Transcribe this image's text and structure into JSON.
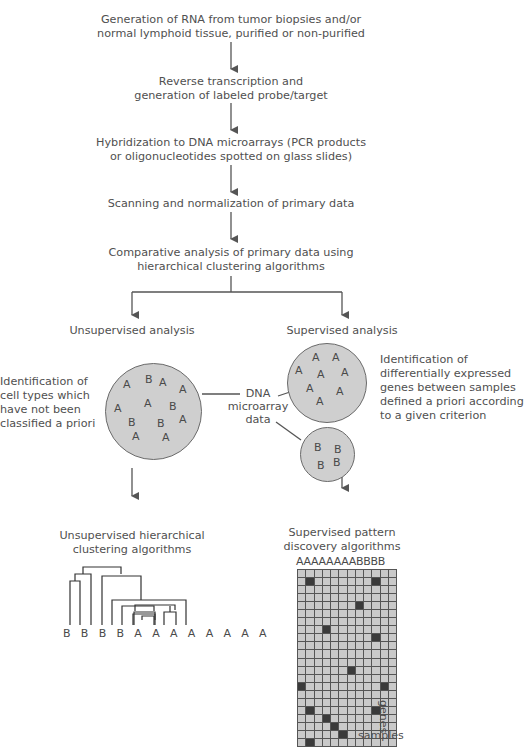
{
  "steps": [
    {
      "line1": "Generation of RNA from tumor biopsies and/or",
      "line2": "normal lymphoid tissue, purified or non-purified"
    },
    {
      "line1": "Reverse transcription and",
      "line2": "generation of labeled probe/target"
    },
    {
      "line1": "Hybridization to DNA microarrays (PCR products",
      "line2": "or oligonucleotides spotted on glass slides)"
    },
    {
      "line1": "Scanning and normalization of primary data",
      "line2": ""
    },
    {
      "line1": "Comparative analysis of primary data using",
      "line2": "hierarchical clustering algorithms"
    }
  ],
  "branches": {
    "unsupervised": {
      "title": "Unsupervised analysis",
      "description": [
        "Identification of",
        "cell types which",
        "have not been",
        "classified a priori"
      ],
      "circle_labels": [
        "A",
        "B",
        "A",
        "A",
        "A",
        "A",
        "B",
        "A",
        "B",
        "B",
        "A",
        "A",
        "A"
      ],
      "algorithm": [
        "Unsupervised hierarchical",
        "clustering algorithms"
      ],
      "dendrogram_leaves": "B B B B A A A A A A A A"
    },
    "supervised": {
      "title": "Supervised analysis",
      "description": [
        "Identification of",
        "differentially expressed",
        "genes between samples",
        "defined a priori according",
        "to a given criterion"
      ],
      "circle_a_labels": [
        "A",
        "A",
        "A",
        "A",
        "A",
        "A",
        "A",
        "A"
      ],
      "circle_b_labels": [
        "B",
        "B",
        "B",
        "B"
      ],
      "algorithm": [
        "Supervised pattern",
        "discovery algorithms"
      ],
      "matrix_header": "AAAAAAAABBBB",
      "matrix_x_label": "samples",
      "matrix_y_label": "genes"
    }
  },
  "center_label": [
    "DNA",
    "microarray",
    "data"
  ],
  "chart_data": {
    "type": "heatmap",
    "columns": [
      "A",
      "A",
      "A",
      "A",
      "A",
      "A",
      "A",
      "A",
      "B",
      "B",
      "B",
      "B"
    ],
    "rows": 22,
    "xlabel": "samples",
    "ylabel": "genes",
    "highlighted_cells": [
      [
        1,
        1
      ],
      [
        1,
        9
      ],
      [
        4,
        7
      ],
      [
        7,
        3
      ],
      [
        8,
        9
      ],
      [
        12,
        6
      ],
      [
        14,
        0
      ],
      [
        14,
        10
      ],
      [
        17,
        1
      ],
      [
        17,
        9
      ],
      [
        18,
        3
      ],
      [
        19,
        4
      ],
      [
        20,
        5
      ],
      [
        21,
        1
      ]
    ]
  },
  "colors": {
    "circle_fill": "#cfcfcf",
    "line": "#555555",
    "cell": "#c9c9c9",
    "cell_on": "#3a3a3a"
  }
}
